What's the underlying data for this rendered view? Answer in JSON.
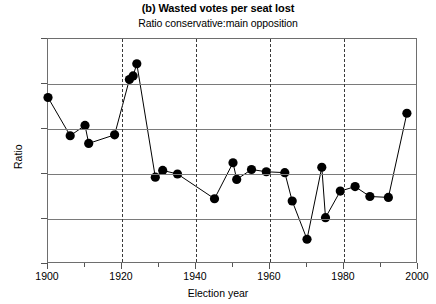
{
  "chart_data": {
    "type": "line",
    "title": "(b) Wasted votes per seat lost",
    "subtitle": "Ratio conservative:main opposition",
    "xlabel": "Election year",
    "ylabel": "Ratio",
    "xlim": [
      1900,
      2000
    ],
    "ylim": [
      0.8,
      1.3
    ],
    "xticks": [
      1900,
      1920,
      1940,
      1960,
      1980,
      2000
    ],
    "xtick_labels": [
      "1900",
      "1920",
      "1940",
      "1960",
      "1980",
      "2000"
    ],
    "xminor_ticks": [
      1910,
      1930,
      1950,
      1970,
      1990
    ],
    "yticks": [
      0.8,
      0.9,
      1.0,
      1.1,
      1.2,
      1.3
    ],
    "ytick_labels": [
      ".8",
      ".9",
      "1.0",
      "1.1",
      "1.2",
      "1.3"
    ],
    "grid": "horizontal",
    "vertical_dashed_lines": [
      1920,
      1940,
      1960,
      1980
    ],
    "legend": "none",
    "marker": "filled-circle",
    "series": [
      {
        "name": "Ratio conservative:main opposition",
        "x": [
          1900,
          1906,
          1910,
          1911,
          1918,
          1922,
          1923,
          1924,
          1929,
          1931,
          1935,
          1945,
          1950,
          1951,
          1955,
          1959,
          1964,
          1966,
          1970,
          1974,
          1975,
          1979,
          1983,
          1987,
          1992,
          1997
        ],
        "values": [
          1.17,
          1.085,
          1.108,
          1.068,
          1.087,
          1.21,
          1.218,
          1.245,
          0.993,
          1.008,
          1.0,
          0.945,
          1.025,
          0.988,
          1.01,
          1.005,
          1.003,
          0.94,
          0.855,
          1.015,
          0.903,
          0.962,
          0.972,
          0.95,
          0.948,
          1.135
        ]
      }
    ]
  }
}
